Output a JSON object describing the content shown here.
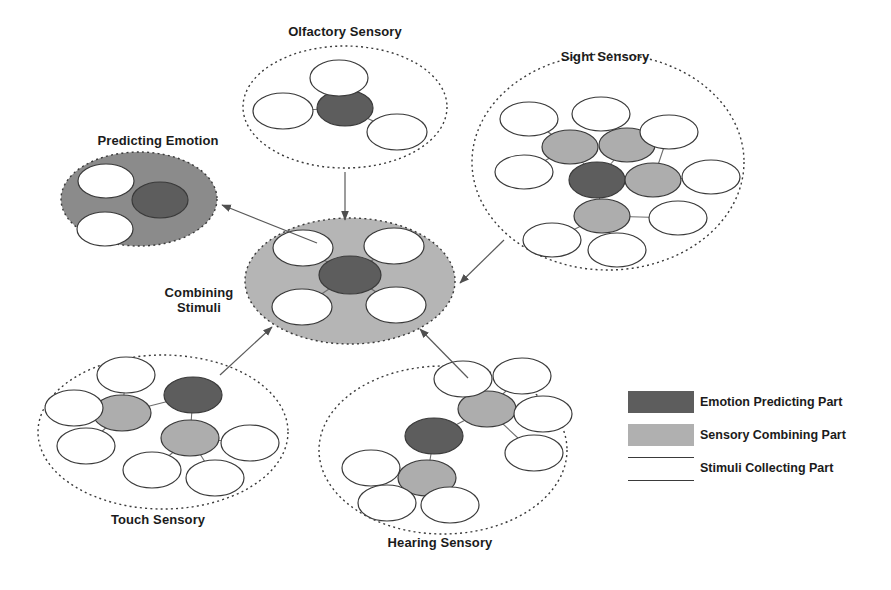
{
  "figure": {
    "background_color": "#ffffff",
    "colors": {
      "emotion_predicting": "#5d5d5d",
      "sensory_combining": "#adadad",
      "stimuli_collecting": "#ffffff",
      "predicting_emotion_fill": "#8b8b8b",
      "combining_stimuli_fill": "#b5b5b5",
      "outline": "#3a3a3a",
      "text": "#1b1b1b",
      "connector": "#6e6e6e",
      "arrow": "#5a5a5a"
    }
  },
  "clusters": [
    {
      "id": "olfactory-sensory",
      "label": "Olfactory Sensory",
      "label_x": 345,
      "label_y": 24,
      "boundary": {
        "cx": 345,
        "cy": 107,
        "rx": 102,
        "ry": 61,
        "style": "dotted",
        "fill": "none"
      },
      "nodes": [
        {
          "type": "emotion_predicting",
          "cx": 345,
          "cy": 108,
          "rx": 28,
          "ry": 18
        },
        {
          "type": "stimuli_collecting",
          "cx": 339,
          "cy": 78,
          "rx": 29,
          "ry": 18
        },
        {
          "type": "stimuli_collecting",
          "cx": 283,
          "cy": 111,
          "rx": 30,
          "ry": 18
        },
        {
          "type": "stimuli_collecting",
          "cx": 397,
          "cy": 132,
          "rx": 30,
          "ry": 18
        }
      ],
      "edges": [
        [
          0,
          1
        ],
        [
          0,
          2
        ],
        [
          0,
          3
        ]
      ]
    },
    {
      "id": "sight-sensory",
      "label": "Sight Sensory",
      "label_x": 605,
      "label_y": 49,
      "boundary": {
        "cx": 608,
        "cy": 162,
        "rx": 136,
        "ry": 108,
        "style": "dotted",
        "fill": "none"
      },
      "nodes": [
        {
          "type": "emotion_predicting",
          "cx": 597,
          "cy": 180,
          "rx": 28,
          "ry": 18
        },
        {
          "type": "sensory_combining",
          "cx": 570,
          "cy": 147,
          "rx": 28,
          "ry": 17
        },
        {
          "type": "sensory_combining",
          "cx": 627,
          "cy": 145,
          "rx": 28,
          "ry": 17
        },
        {
          "type": "sensory_combining",
          "cx": 653,
          "cy": 180,
          "rx": 28,
          "ry": 17
        },
        {
          "type": "sensory_combining",
          "cx": 602,
          "cy": 216,
          "rx": 28,
          "ry": 17
        },
        {
          "type": "stimuli_collecting",
          "cx": 529,
          "cy": 119,
          "rx": 29,
          "ry": 17
        },
        {
          "type": "stimuli_collecting",
          "cx": 601,
          "cy": 114,
          "rx": 29,
          "ry": 17
        },
        {
          "type": "stimuli_collecting",
          "cx": 669,
          "cy": 132,
          "rx": 29,
          "ry": 17
        },
        {
          "type": "stimuli_collecting",
          "cx": 524,
          "cy": 172,
          "rx": 29,
          "ry": 17
        },
        {
          "type": "stimuli_collecting",
          "cx": 711,
          "cy": 177,
          "rx": 29,
          "ry": 17
        },
        {
          "type": "stimuli_collecting",
          "cx": 678,
          "cy": 218,
          "rx": 29,
          "ry": 17
        },
        {
          "type": "stimuli_collecting",
          "cx": 552,
          "cy": 240,
          "rx": 29,
          "ry": 17
        },
        {
          "type": "stimuli_collecting",
          "cx": 617,
          "cy": 250,
          "rx": 29,
          "ry": 17
        }
      ],
      "edges": [
        [
          0,
          1
        ],
        [
          0,
          2
        ],
        [
          0,
          3
        ],
        [
          0,
          4
        ],
        [
          1,
          5
        ],
        [
          2,
          6
        ],
        [
          3,
          7
        ],
        [
          1,
          8
        ],
        [
          3,
          9
        ],
        [
          4,
          10
        ],
        [
          4,
          11
        ],
        [
          4,
          12
        ]
      ]
    },
    {
      "id": "touch-sensory",
      "label": "Touch Sensory",
      "label_x": 158,
      "label_y": 512,
      "boundary": {
        "cx": 163,
        "cy": 432,
        "rx": 125,
        "ry": 77,
        "style": "dotted",
        "fill": "none"
      },
      "nodes": [
        {
          "type": "emotion_predicting",
          "cx": 193,
          "cy": 395,
          "rx": 29,
          "ry": 18
        },
        {
          "type": "sensory_combining",
          "cx": 122,
          "cy": 413,
          "rx": 29,
          "ry": 18
        },
        {
          "type": "sensory_combining",
          "cx": 190,
          "cy": 438,
          "rx": 29,
          "ry": 18
        },
        {
          "type": "stimuli_collecting",
          "cx": 126,
          "cy": 375,
          "rx": 29,
          "ry": 18
        },
        {
          "type": "stimuli_collecting",
          "cx": 74,
          "cy": 408,
          "rx": 29,
          "ry": 18
        },
        {
          "type": "stimuli_collecting",
          "cx": 86,
          "cy": 446,
          "rx": 29,
          "ry": 18
        },
        {
          "type": "stimuli_collecting",
          "cx": 152,
          "cy": 470,
          "rx": 29,
          "ry": 18
        },
        {
          "type": "stimuli_collecting",
          "cx": 215,
          "cy": 478,
          "rx": 29,
          "ry": 18
        },
        {
          "type": "stimuli_collecting",
          "cx": 250,
          "cy": 443,
          "rx": 29,
          "ry": 18
        }
      ],
      "edges": [
        [
          0,
          1
        ],
        [
          0,
          2
        ],
        [
          1,
          3
        ],
        [
          1,
          4
        ],
        [
          1,
          5
        ],
        [
          2,
          6
        ],
        [
          2,
          7
        ],
        [
          2,
          8
        ]
      ]
    },
    {
      "id": "hearing-sensory",
      "label": "Hearing Sensory",
      "label_x": 440,
      "label_y": 535,
      "boundary": {
        "cx": 443,
        "cy": 450,
        "rx": 124,
        "ry": 84,
        "style": "dotted",
        "fill": "none"
      },
      "nodes": [
        {
          "type": "emotion_predicting",
          "cx": 434,
          "cy": 436,
          "rx": 29,
          "ry": 18
        },
        {
          "type": "sensory_combining",
          "cx": 487,
          "cy": 409,
          "rx": 29,
          "ry": 18
        },
        {
          "type": "sensory_combining",
          "cx": 427,
          "cy": 478,
          "rx": 29,
          "ry": 18
        },
        {
          "type": "stimuli_collecting",
          "cx": 463,
          "cy": 379,
          "rx": 29,
          "ry": 18
        },
        {
          "type": "stimuli_collecting",
          "cx": 522,
          "cy": 376,
          "rx": 29,
          "ry": 18
        },
        {
          "type": "stimuli_collecting",
          "cx": 543,
          "cy": 414,
          "rx": 29,
          "ry": 18
        },
        {
          "type": "stimuli_collecting",
          "cx": 534,
          "cy": 453,
          "rx": 29,
          "ry": 18
        },
        {
          "type": "stimuli_collecting",
          "cx": 371,
          "cy": 468,
          "rx": 29,
          "ry": 18
        },
        {
          "type": "stimuli_collecting",
          "cx": 387,
          "cy": 503,
          "rx": 29,
          "ry": 18
        },
        {
          "type": "stimuli_collecting",
          "cx": 450,
          "cy": 505,
          "rx": 29,
          "ry": 18
        }
      ],
      "edges": [
        [
          0,
          1
        ],
        [
          0,
          2
        ],
        [
          1,
          3
        ],
        [
          1,
          4
        ],
        [
          1,
          5
        ],
        [
          1,
          6
        ],
        [
          2,
          7
        ],
        [
          2,
          8
        ],
        [
          2,
          9
        ]
      ]
    },
    {
      "id": "combining-stimuli",
      "label": "Combining\nStimuli",
      "label_x": 199,
      "label_y": 285,
      "boundary": {
        "cx": 350,
        "cy": 281,
        "rx": 105,
        "ry": 63,
        "style": "dotted",
        "fill": "#b5b5b5"
      },
      "nodes": [
        {
          "type": "emotion_predicting",
          "cx": 350,
          "cy": 275,
          "rx": 31,
          "ry": 19
        },
        {
          "type": "stimuli_collecting",
          "cx": 303,
          "cy": 248,
          "rx": 30,
          "ry": 18
        },
        {
          "type": "stimuli_collecting",
          "cx": 394,
          "cy": 246,
          "rx": 30,
          "ry": 18
        },
        {
          "type": "stimuli_collecting",
          "cx": 302,
          "cy": 307,
          "rx": 30,
          "ry": 18
        },
        {
          "type": "stimuli_collecting",
          "cx": 396,
          "cy": 305,
          "rx": 30,
          "ry": 18
        }
      ],
      "edges": [
        [
          0,
          1
        ],
        [
          0,
          2
        ],
        [
          0,
          3
        ],
        [
          0,
          4
        ]
      ]
    },
    {
      "id": "predicting-emotion",
      "label": "Predicting Emotion",
      "label_x": 158,
      "label_y": 133,
      "boundary": {
        "cx": 139,
        "cy": 199,
        "rx": 78,
        "ry": 47,
        "style": "dotted",
        "fill": "#8b8b8b"
      },
      "nodes": [
        {
          "type": "emotion_predicting",
          "cx": 160,
          "cy": 200,
          "rx": 28,
          "ry": 18
        },
        {
          "type": "stimuli_collecting",
          "cx": 106,
          "cy": 181,
          "rx": 28,
          "ry": 17
        },
        {
          "type": "stimuli_collecting",
          "cx": 105,
          "cy": 229,
          "rx": 28,
          "ry": 17
        }
      ],
      "edges": []
    }
  ],
  "arrows": [
    {
      "id": "olfactory-to-combining",
      "x1": 345,
      "y1": 172,
      "x2": 345,
      "y2": 220
    },
    {
      "id": "sight-to-combining",
      "x1": 504,
      "y1": 240,
      "x2": 460,
      "y2": 283
    },
    {
      "id": "touch-to-combining",
      "x1": 220,
      "y1": 375,
      "x2": 272,
      "y2": 327
    },
    {
      "id": "hearing-to-combining",
      "x1": 468,
      "y1": 378,
      "x2": 420,
      "y2": 329
    },
    {
      "id": "combining-to-predicting",
      "x1": 317,
      "y1": 243,
      "x2": 222,
      "y2": 205
    }
  ],
  "legend": {
    "items": [
      {
        "id": "emotion-predicting-part",
        "label": "Emotion Predicting Part",
        "swatch": "#5d5d5d",
        "style": "filled",
        "swatch_x": 628,
        "swatch_y": 391,
        "label_x": 700,
        "label_y": 392
      },
      {
        "id": "sensory-combining-part",
        "label": "Sensory Combining Part",
        "swatch": "#b0b0b0",
        "style": "filled",
        "swatch_x": 628,
        "swatch_y": 424,
        "label_x": 700,
        "label_y": 425
      },
      {
        "id": "stimuli-collecting-part",
        "label": "Stimuli Collecting Part",
        "swatch": "#ffffff",
        "style": "outlined",
        "swatch_x": 628,
        "swatch_y": 457,
        "label_x": 700,
        "label_y": 458
      }
    ],
    "swatch_width": 66,
    "swatch_height": 22
  }
}
